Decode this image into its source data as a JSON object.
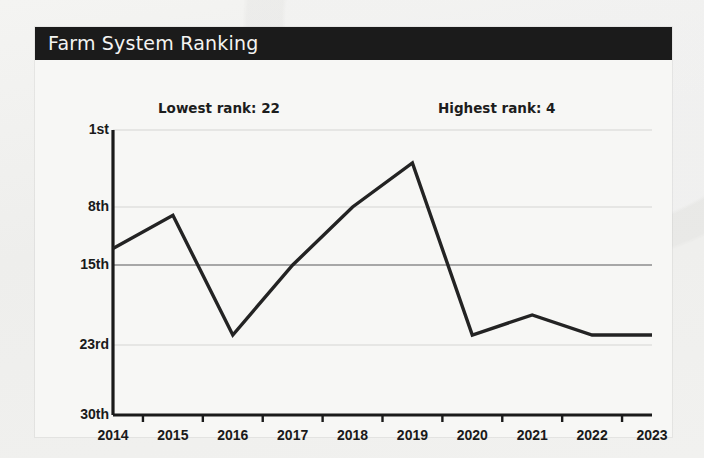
{
  "card": {
    "title": "Farm System Ranking"
  },
  "annotations": [
    {
      "name": "lowest-rank-annotation",
      "text": "Lowest rank: 22"
    },
    {
      "name": "highest-rank-annotation",
      "text": "Highest rank: 4"
    }
  ],
  "colors": {
    "header_bg": "#1b1b1b",
    "header_text": "#f4f4f2",
    "card_bg": "#f7f7f5",
    "line": "#232323",
    "axis": "#1a1a1a",
    "gridline": "#d5d5d3",
    "gridline_major": "#8d8d8d"
  },
  "chart_data": {
    "type": "line",
    "title": "Farm System Ranking",
    "xlabel": "",
    "ylabel": "",
    "x": [
      2014,
      2015,
      2016,
      2017,
      2018,
      2019,
      2020,
      2021,
      2022,
      2023
    ],
    "categories": [
      "2014",
      "2015",
      "2016",
      "2017",
      "2018",
      "2019",
      "2020",
      "2021",
      "2022",
      "2023"
    ],
    "series": [
      {
        "name": "Farm system rank",
        "values": [
          13,
          9,
          22,
          15,
          8,
          4,
          22,
          20,
          22,
          22
        ]
      }
    ],
    "y_tick_labels": [
      "1st",
      "8th",
      "15th",
      "23rd",
      "30th"
    ],
    "y_tick_values": [
      1,
      8,
      15,
      23,
      30
    ],
    "ylim": [
      1,
      30
    ],
    "y_inverted": true,
    "grid": true,
    "legend": false,
    "annotations": [
      "Lowest rank: 22",
      "Highest rank: 4"
    ]
  }
}
